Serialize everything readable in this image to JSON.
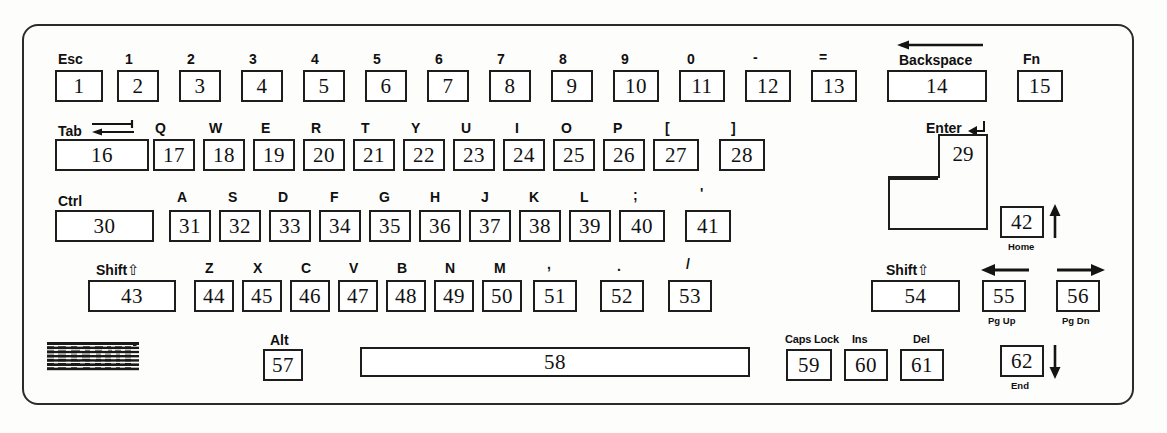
{
  "diagram": {
    "brand": "IBM",
    "ink_color": "#1d1d1d",
    "paper_color": "#fdfdfb"
  },
  "rows": {
    "row1": {
      "name": "number-row",
      "keys": [
        {
          "num": "1",
          "legend": "Esc"
        },
        {
          "num": "2",
          "legend": "1"
        },
        {
          "num": "3",
          "legend": "2"
        },
        {
          "num": "4",
          "legend": "3"
        },
        {
          "num": "5",
          "legend": "4"
        },
        {
          "num": "6",
          "legend": "5"
        },
        {
          "num": "7",
          "legend": "6"
        },
        {
          "num": "8",
          "legend": "7"
        },
        {
          "num": "9",
          "legend": "8"
        },
        {
          "num": "10",
          "legend": "9"
        },
        {
          "num": "11",
          "legend": "0"
        },
        {
          "num": "12",
          "legend": "-"
        },
        {
          "num": "13",
          "legend": "="
        },
        {
          "num": "14",
          "legend": "Backspace"
        },
        {
          "num": "15",
          "legend": "Fn"
        }
      ]
    },
    "row2": {
      "name": "qwerty-row",
      "keys": [
        {
          "num": "16",
          "legend": "Tab"
        },
        {
          "num": "17",
          "legend": "Q"
        },
        {
          "num": "18",
          "legend": "W"
        },
        {
          "num": "19",
          "legend": "E"
        },
        {
          "num": "20",
          "legend": "R"
        },
        {
          "num": "21",
          "legend": "T"
        },
        {
          "num": "22",
          "legend": "Y"
        },
        {
          "num": "23",
          "legend": "U"
        },
        {
          "num": "24",
          "legend": "I"
        },
        {
          "num": "25",
          "legend": "O"
        },
        {
          "num": "26",
          "legend": "P"
        },
        {
          "num": "27",
          "legend": "["
        },
        {
          "num": "28",
          "legend": "]"
        },
        {
          "num": "29",
          "legend": "Enter"
        }
      ]
    },
    "row3": {
      "name": "home-row",
      "keys": [
        {
          "num": "30",
          "legend": "Ctrl"
        },
        {
          "num": "31",
          "legend": "A"
        },
        {
          "num": "32",
          "legend": "S"
        },
        {
          "num": "33",
          "legend": "D"
        },
        {
          "num": "34",
          "legend": "F"
        },
        {
          "num": "35",
          "legend": "G"
        },
        {
          "num": "36",
          "legend": "H"
        },
        {
          "num": "37",
          "legend": "J"
        },
        {
          "num": "38",
          "legend": "K"
        },
        {
          "num": "39",
          "legend": "L"
        },
        {
          "num": "40",
          "legend": ";"
        },
        {
          "num": "41",
          "legend": "'"
        },
        {
          "num": "42",
          "legend": "",
          "legend_below": "Home"
        }
      ]
    },
    "row4": {
      "name": "shift-row",
      "keys": [
        {
          "num": "43",
          "legend": "Shift"
        },
        {
          "num": "44",
          "legend": "Z"
        },
        {
          "num": "45",
          "legend": "X"
        },
        {
          "num": "46",
          "legend": "C"
        },
        {
          "num": "47",
          "legend": "V"
        },
        {
          "num": "48",
          "legend": "B"
        },
        {
          "num": "49",
          "legend": "N"
        },
        {
          "num": "50",
          "legend": "M"
        },
        {
          "num": "51",
          "legend": ","
        },
        {
          "num": "52",
          "legend": "."
        },
        {
          "num": "53",
          "legend": "/"
        },
        {
          "num": "54",
          "legend": "Shift"
        },
        {
          "num": "55",
          "legend": "",
          "legend_below": "Pg Up"
        },
        {
          "num": "56",
          "legend": "",
          "legend_below": "Pg Dn"
        }
      ]
    },
    "row5": {
      "name": "bottom-row",
      "keys": [
        {
          "num": "57",
          "legend": "Alt"
        },
        {
          "num": "58",
          "legend": ""
        },
        {
          "num": "59",
          "legend": "Caps Lock"
        },
        {
          "num": "60",
          "legend": "Ins"
        },
        {
          "num": "61",
          "legend": "Del"
        },
        {
          "num": "62",
          "legend": "",
          "legend_below": "End"
        }
      ]
    }
  },
  "glyphs": {
    "shift_arrow": "⇧",
    "backspace_arrow": "left-arrow",
    "tab_arrows": "tab-arrows",
    "enter_arrow": "enter-corner-arrow",
    "up_arrow": "up-arrow",
    "down_arrow": "down-arrow",
    "left_arrow": "left-arrow",
    "right_arrow": "right-arrow"
  }
}
